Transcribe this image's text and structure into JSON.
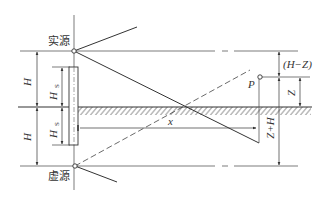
{
  "diagram": {
    "labels": {
      "real_source": "实源",
      "virtual_source": "虚源",
      "H_upper": "H",
      "H_lower": "H",
      "Hs_upper": "H",
      "Hs_upper_sub": "S",
      "Hs_lower": "H",
      "Hs_lower_sub": "S",
      "x": "x",
      "P": "P",
      "H_minus_Z": "(H−Z)",
      "Z": "Z",
      "Z_plus_H": "Z+H"
    },
    "colors": {
      "line": "#333333",
      "hatch": "#555555",
      "background": "#ffffff"
    }
  }
}
